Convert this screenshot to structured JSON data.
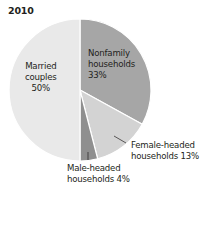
{
  "chart_data": {
    "type": "pie",
    "title": "2010",
    "categories": [
      "Nonfamily households",
      "Female-headed households",
      "Male-headed households",
      "Married couples"
    ],
    "values": [
      33,
      13,
      4,
      50
    ],
    "unit": "%",
    "start_angle": "12 o'clock",
    "direction": "clockwise",
    "colors": [
      "#a6a6a6",
      "#d3d3d3",
      "#8f8f8f",
      "#e9e9e9"
    ],
    "labels": [
      {
        "line1": "Nonfamily",
        "line2": "households",
        "line3": "33%"
      },
      {
        "line1": "Female-headed",
        "line2": "households 13%"
      },
      {
        "line1": "Male-headed",
        "line2": "households 4%"
      },
      {
        "line1": "Married",
        "line2": "couples",
        "line3": "50%"
      }
    ]
  }
}
